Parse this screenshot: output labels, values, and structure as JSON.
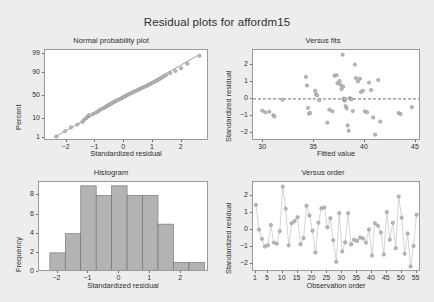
{
  "figure": {
    "title": "Residual plots for affordm15",
    "background_color": "#ededed",
    "panel_background_color": "#ffffff",
    "point_color": "#b9b9b9",
    "bar_color": "#b3b3b3"
  },
  "chart_data": [
    {
      "type": "scatter",
      "id": "normal-probability-plot",
      "title": "Normal probability plot",
      "xlabel": "Standardized residual",
      "ylabel": "Percent",
      "xlim": [
        -2.75,
        2.95
      ],
      "ylim": [
        0.6,
        99.5
      ],
      "yscale": "probability",
      "xticks": [
        -2,
        -1,
        0,
        1,
        2
      ],
      "yticks": [
        1,
        10,
        50,
        90,
        99
      ],
      "grid": false,
      "reference_line": {
        "from": [
          -2.45,
          1
        ],
        "to": [
          2.62,
          99
        ]
      },
      "x": [
        -2.35,
        -2.05,
        -1.85,
        -1.62,
        -1.45,
        -1.4,
        -1.32,
        -1.28,
        -1.22,
        -1.08,
        -0.98,
        -0.9,
        -0.86,
        -0.8,
        -0.72,
        -0.66,
        -0.6,
        -0.55,
        -0.5,
        -0.44,
        -0.38,
        -0.33,
        -0.28,
        -0.22,
        -0.16,
        -0.1,
        -0.05,
        0.0,
        0.05,
        0.1,
        0.15,
        0.22,
        0.28,
        0.33,
        0.4,
        0.46,
        0.52,
        0.58,
        0.65,
        0.72,
        0.8,
        0.86,
        0.92,
        1.0,
        1.08,
        1.15,
        1.22,
        1.3,
        1.38,
        1.46,
        1.6,
        1.78,
        1.98,
        2.2,
        2.62
      ],
      "percent": [
        1.2,
        2.5,
        4.0,
        5.6,
        7.3,
        9.0,
        10.8,
        12.5,
        14.3,
        16.1,
        17.9,
        19.7,
        21.5,
        23.3,
        25.1,
        26.9,
        28.7,
        30.5,
        32.3,
        34.1,
        35.9,
        37.7,
        39.5,
        41.3,
        43.1,
        44.9,
        46.7,
        48.5,
        50.3,
        52.1,
        53.9,
        55.7,
        57.5,
        59.3,
        61.1,
        62.9,
        64.7,
        66.5,
        68.3,
        70.1,
        71.9,
        73.7,
        75.5,
        77.3,
        79.1,
        80.9,
        82.7,
        84.5,
        86.3,
        88.1,
        90.0,
        92.0,
        94.0,
        96.5,
        98.8
      ]
    },
    {
      "type": "scatter",
      "id": "versus-fits-plot",
      "title": "Versus fits",
      "xlabel": "Fitted value",
      "ylabel": "Standardized residual",
      "xlim": [
        29.0,
        45.5
      ],
      "ylim": [
        -2.45,
        2.85
      ],
      "xticks": [
        30,
        35,
        40,
        45
      ],
      "yticks": [
        -2,
        -1,
        0,
        1,
        2
      ],
      "grid": false,
      "zero_line": 0,
      "x": [
        29.9,
        30.2,
        30.6,
        31.0,
        31.1,
        31.9,
        34.2,
        34.3,
        34.4,
        34.5,
        34.6,
        35.1,
        35.2,
        35.3,
        35.5,
        36.3,
        36.5,
        36.8,
        37.0,
        37.2,
        37.3,
        37.5,
        37.6,
        37.7,
        37.8,
        37.85,
        37.9,
        37.95,
        38.0,
        38.05,
        38.1,
        38.2,
        38.3,
        38.4,
        38.5,
        38.6,
        38.7,
        38.8,
        39.0,
        39.1,
        39.3,
        39.5,
        39.6,
        39.8,
        40.0,
        40.2,
        40.4,
        40.6,
        40.8,
        41.0,
        41.3,
        41.5,
        43.3,
        43.5,
        44.6
      ],
      "y": [
        -0.68,
        -0.78,
        -0.75,
        -0.95,
        -1.02,
        -0.05,
        1.28,
        0.78,
        -0.52,
        -0.85,
        -0.82,
        0.48,
        0.28,
        0.2,
        -0.08,
        -1.38,
        -0.62,
        -0.72,
        1.35,
        1.38,
        0.92,
        1.05,
        0.82,
        0.58,
        2.58,
        0.72,
        0.02,
        -0.05,
        -0.1,
        0.0,
        -0.42,
        -0.55,
        -1.55,
        -1.85,
        0.05,
        0.0,
        -0.02,
        -0.7,
        2.0,
        1.22,
        1.02,
        1.18,
        0.4,
        0.48,
        -0.72,
        -0.78,
        0.95,
        0.52,
        -1.08,
        -2.08,
        1.1,
        -1.32,
        -0.82,
        -0.88,
        -0.48
      ]
    },
    {
      "type": "bar",
      "id": "histogram",
      "title": "Histogram",
      "xlabel": "Standardized residual",
      "ylabel": "Frequency",
      "xlim": [
        -2.6,
        2.9
      ],
      "ylim": [
        0,
        9.4
      ],
      "xticks": [
        -2,
        -1,
        0,
        1,
        2
      ],
      "yticks": [
        0,
        2,
        4,
        6,
        8
      ],
      "grid": false,
      "bin_edges": [
        -2.25,
        -1.75,
        -1.25,
        -0.75,
        -0.25,
        0.25,
        0.75,
        1.25,
        1.75,
        2.25,
        2.75
      ],
      "values": [
        2,
        4,
        9,
        8,
        9,
        8,
        8,
        5,
        1,
        1
      ]
    },
    {
      "type": "line",
      "id": "versus-order-plot",
      "title": "Versus order",
      "xlabel": "Observation order",
      "ylabel": "Standardized residual",
      "xlim": [
        0,
        56.5
      ],
      "ylim": [
        -2.45,
        2.85
      ],
      "xticks": [
        1,
        5,
        10,
        15,
        20,
        25,
        30,
        35,
        40,
        45,
        50,
        55
      ],
      "yticks": [
        -2,
        -1,
        0,
        1,
        2
      ],
      "grid": false,
      "x": [
        1,
        2,
        3,
        4,
        5,
        6,
        7,
        8,
        9,
        10,
        11,
        12,
        13,
        14,
        15,
        16,
        17,
        18,
        19,
        20,
        21,
        22,
        23,
        24,
        25,
        26,
        27,
        28,
        29,
        30,
        31,
        32,
        33,
        34,
        35,
        36,
        37,
        38,
        39,
        40,
        41,
        42,
        43,
        44,
        45,
        46,
        47,
        48,
        49,
        50,
        51,
        52,
        53,
        54,
        55
      ],
      "values": [
        1.5,
        0.05,
        -0.5,
        -0.95,
        -0.88,
        0.32,
        -0.72,
        -0.78,
        -0.05,
        2.58,
        1.28,
        -0.88,
        0.42,
        0.55,
        0.78,
        -0.82,
        -0.45,
        1.45,
        0.88,
        -0.02,
        -1.3,
        0.45,
        1.3,
        1.35,
        0.18,
        0.72,
        -0.58,
        -1.85,
        1.02,
        -1.25,
        -0.7,
        1.02,
        -0.82,
        -0.55,
        -0.62,
        -0.42,
        -0.48,
        -0.72,
        0.05,
        -1.48,
        0.42,
        0.28,
        -0.12,
        -1.42,
        1.08,
        -0.55,
        0.45,
        -1.05,
        2.0,
        0.75,
        -1.38,
        -0.18,
        -2.12,
        -0.92,
        0.92
      ]
    }
  ]
}
